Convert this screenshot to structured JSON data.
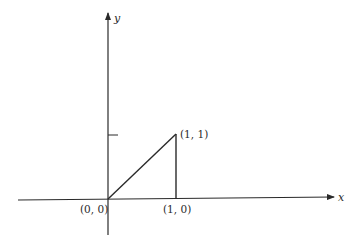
{
  "diagram": {
    "type": "coordinate-plane-triangle",
    "axes": {
      "x_label": "x",
      "y_label": "y"
    },
    "points": [
      {
        "label": "(0, 0)",
        "x": 0,
        "y": 0
      },
      {
        "label": "(1, 0)",
        "x": 1,
        "y": 0
      },
      {
        "label": "(1, 1)",
        "x": 1,
        "y": 1
      }
    ],
    "y_tick": {
      "value": 1
    },
    "colors": {
      "line": "#2a2a2a",
      "background": "#ffffff"
    }
  }
}
